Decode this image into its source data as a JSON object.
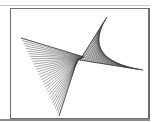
{
  "figure": {
    "frame": {
      "x": 10,
      "y": 8,
      "width": 137,
      "height": 109,
      "stroke": "#6e6e6e"
    },
    "line_color": "#3a3a3a",
    "left_fan": {
      "edge_start": [
        21,
        38
      ],
      "edge_end": [
        59,
        116
      ],
      "hub_start": [
        84,
        57
      ],
      "hub_end": [
        77,
        61
      ],
      "line_count": 30
    },
    "right_envelope": {
      "top_point": [
        107,
        17
      ],
      "corner_point": [
        80,
        60
      ],
      "right_point": [
        143,
        70
      ],
      "line_count": 28
    }
  }
}
